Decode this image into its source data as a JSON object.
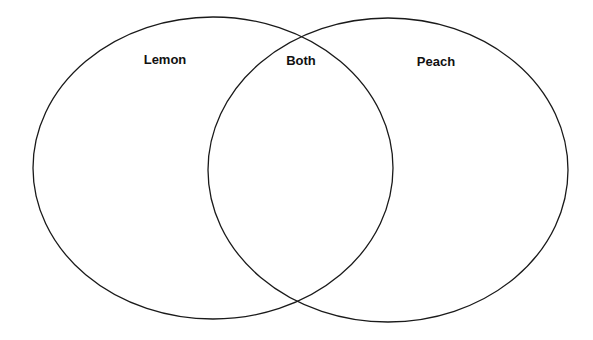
{
  "diagram": {
    "type": "venn",
    "stroke_color": "#1a1a1a",
    "background": "#ffffff",
    "sets": [
      {
        "id": "left",
        "label": "Lemon",
        "cx": 213,
        "cy": 168,
        "rx": 180,
        "ry": 151
      },
      {
        "id": "right",
        "label": "Peach",
        "cx": 388,
        "cy": 170,
        "rx": 180,
        "ry": 152
      }
    ],
    "intersection": {
      "label": "Both"
    },
    "labels": {
      "left": "Lemon",
      "center": "Both",
      "right": "Peach"
    }
  }
}
